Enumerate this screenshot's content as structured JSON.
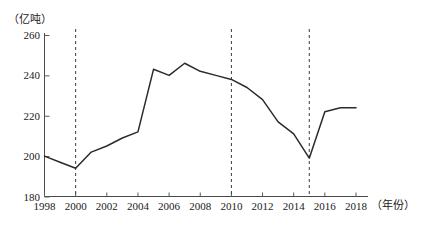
{
  "chart_data": {
    "type": "line",
    "title": "",
    "subtitle": "",
    "xlabel": "（年份）",
    "ylabel": "（亿吨）",
    "xlim": [
      1998,
      2018
    ],
    "ylim": [
      180,
      260
    ],
    "grid": false,
    "legend": "none",
    "y_ticks": [
      "180",
      "200",
      "220",
      "240",
      "260"
    ],
    "y_tick_values": [
      180,
      200,
      220,
      240,
      260
    ],
    "x_ticks": [
      "1998",
      "2000",
      "2002",
      "2004",
      "2006",
      "2008",
      "2010",
      "2012",
      "2014",
      "2016",
      "2018"
    ],
    "x_tick_values": [
      1998,
      2000,
      2002,
      2004,
      2006,
      2008,
      2010,
      2012,
      2014,
      2016,
      2018
    ],
    "x": [
      1998,
      1999,
      2000,
      2001,
      2002,
      2003,
      2004,
      2005,
      2006,
      2007,
      2008,
      2009,
      2010,
      2011,
      2012,
      2013,
      2014,
      2015,
      2016,
      2017,
      2018
    ],
    "values": [
      200,
      197,
      194,
      202,
      205,
      209,
      212,
      243,
      240,
      246,
      242,
      240,
      238,
      234,
      228,
      217,
      211,
      199,
      222,
      224,
      224
    ],
    "series": [
      {
        "name": "粮食产量",
        "values": [
          200,
          197,
          194,
          202,
          205,
          209,
          212,
          243,
          240,
          246,
          242,
          240,
          238,
          234,
          228,
          217,
          211,
          199,
          222,
          224,
          224
        ]
      }
    ],
    "annotations": [
      {
        "type": "vertical-dashed",
        "x": 2000,
        "label": "2000"
      },
      {
        "type": "vertical-dashed",
        "x": 2010,
        "label": "2010"
      },
      {
        "type": "vertical-dashed",
        "x": 2015,
        "label": "2015"
      }
    ],
    "colors": {
      "line": "#2b2b2b",
      "axis": "#4a4a4a",
      "dashed": "#3a3a3a",
      "text": "#1a1a1a",
      "background": "#ffffff"
    }
  }
}
